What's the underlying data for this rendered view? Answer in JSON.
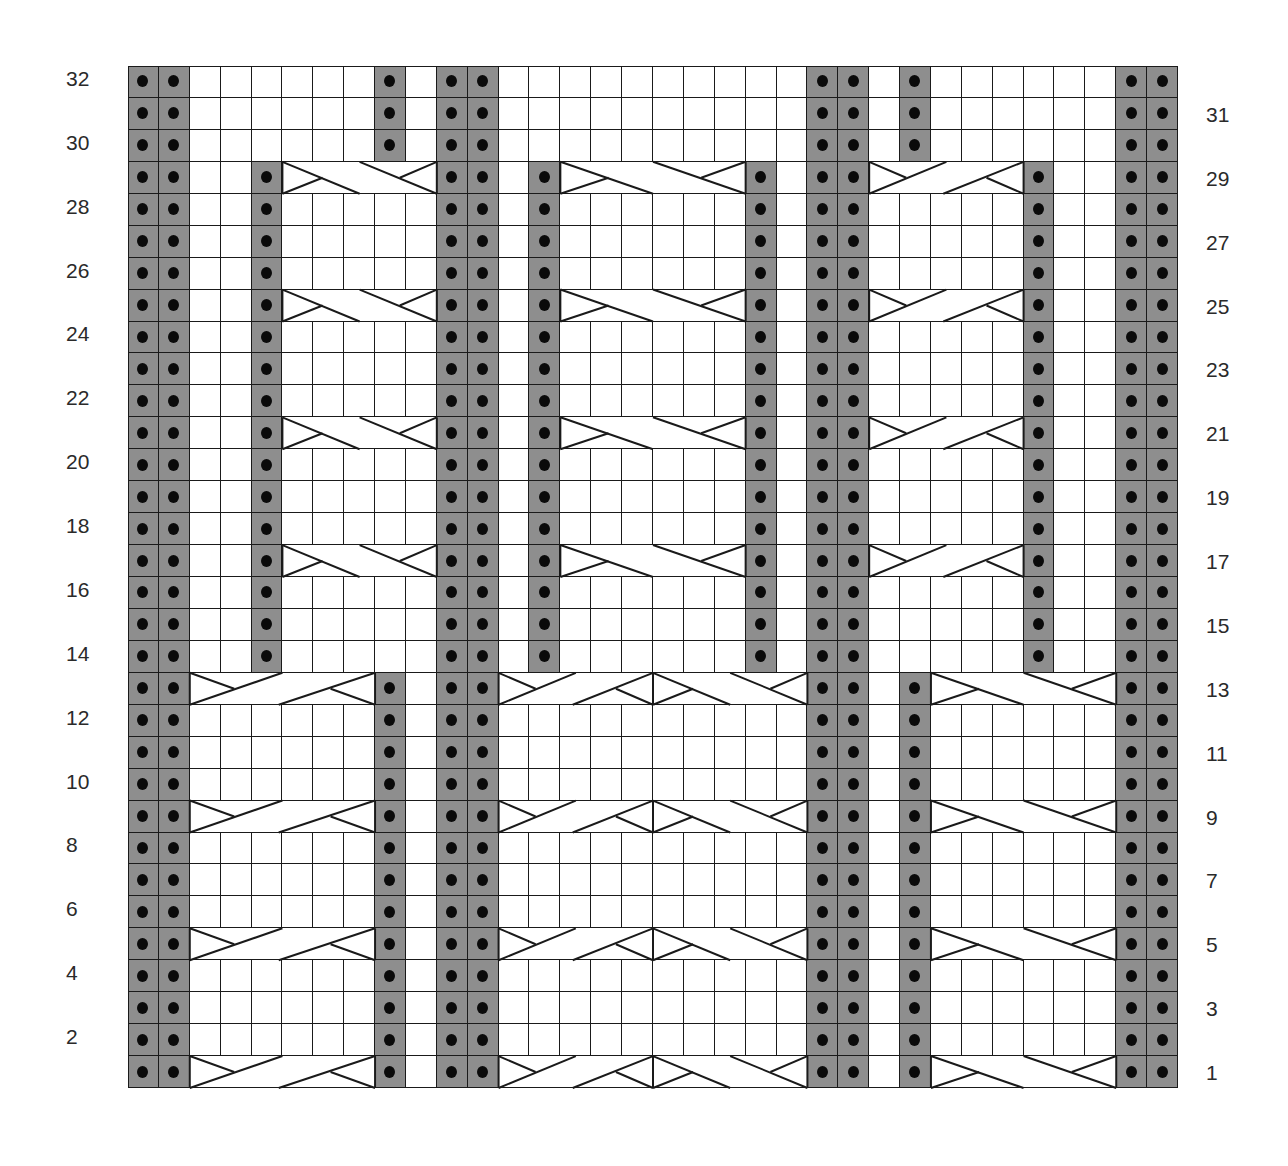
{
  "chart_data": {
    "type": "knitting-chart",
    "columns": 34,
    "rows": 32,
    "legend_key": {
      "p": "purl (gray cell with dot)",
      "k": "knit (white)",
      "L": "left-cross cable",
      "R": "right-cross cable"
    },
    "colors": {
      "purl": "#8e8e8e",
      "knit": "#ffffff",
      "dot": "#0a0a0a",
      "line": "#1a1a1a"
    },
    "grid_rows_top_to_bottom": [
      {
        "row": 32,
        "cells": "ppkkkkkkpkppkkkkkkkkkkppkpkkkkkkpp"
      },
      {
        "row": 31,
        "cells": "ppkkkkkkpkppkkkkkkkkkkppkpkkkkkkpp"
      },
      {
        "row": 30,
        "cells": "ppkkkkkkpkppkkkkkkkkkkppkpkkkkkkpp"
      },
      {
        "row": 29,
        "cells": "ppkkpRRRRRppkpRRRRRRpkppLLLLLpkkpp"
      },
      {
        "row": 28,
        "cells": "ppkkpkkkkkppkpkkkkkkpkppkkkkkpkkpp"
      },
      {
        "row": 27,
        "cells": "ppkkpkkkkkppkpkkkkkkpkppkkkkkpkkpp"
      },
      {
        "row": 26,
        "cells": "ppkkpkkkkkppkpkkkkkkpkppkkkkkpkkpp"
      },
      {
        "row": 25,
        "cells": "ppkkpRRRRRppkpRRRRRRpkppLLLLLpkkpp"
      },
      {
        "row": 24,
        "cells": "ppkkpkkkkkppkpkkkkkkpkppkkkkkpkkpp"
      },
      {
        "row": 23,
        "cells": "ppkkpkkkkkppkpkkkkkkpkppkkkkkpkkpp"
      },
      {
        "row": 22,
        "cells": "ppkkpkkkkkppkpkkkkkkpkppkkkkkpkkpp"
      },
      {
        "row": 21,
        "cells": "ppkkpRRRRRppkpRRRRRRpkppLLLLLpkkpp"
      },
      {
        "row": 20,
        "cells": "ppkkpkkkkkppkpkkkkkkpkppkkkkkpkkpp"
      },
      {
        "row": 19,
        "cells": "ppkkpkkkkkppkpkkkkkkpkppkkkkkpkkpp"
      },
      {
        "row": 18,
        "cells": "ppkkpkkkkkppkpkkkkkkpkppkkkkkpkkpp"
      },
      {
        "row": 17,
        "cells": "ppkkpRRRRRppkpRRRRRRpkppLLLLLpkkpp"
      },
      {
        "row": 16,
        "cells": "ppkkpkkkkkppkpkkkkkkpkppkkkkkpkkpp"
      },
      {
        "row": 15,
        "cells": "ppkkpkkkkkppkpkkkkkkpkppkkkkkpkkpp"
      },
      {
        "row": 14,
        "cells": "ppkkpkkkkkppkpkkkkkkpkppkkkkkpkkpp"
      },
      {
        "row": 13,
        "cells": "ppLLLLLLpkppLLLLLRRRRRppkpRRRRRRpp"
      },
      {
        "row": 12,
        "cells": "ppkkkkkkpkppkkkkkkkkkkppkpkkkkkkpp"
      },
      {
        "row": 11,
        "cells": "ppkkkkkkpkppkkkkkkkkkkppkpkkkkkkpp"
      },
      {
        "row": 10,
        "cells": "ppkkkkkkpkppkkkkkkkkkkppkpkkkkkkpp"
      },
      {
        "row": 9,
        "cells": "ppLLLLLLpkppLLLLLRRRRRppkpRRRRRRpp"
      },
      {
        "row": 8,
        "cells": "ppkkkkkkpkppkkkkkkkkkkppkpkkkkkkpp"
      },
      {
        "row": 7,
        "cells": "ppkkkkkkpkppkkkkkkkkkkppkpkkkkkkpp"
      },
      {
        "row": 6,
        "cells": "ppkkkkkkpkppkkkkkkkkkkppkpkkkkkkpp"
      },
      {
        "row": 5,
        "cells": "ppLLLLLLpkppLLLLLRRRRRppkpRRRRRRpp"
      },
      {
        "row": 4,
        "cells": "ppkkkkkkpkppkkkkkkkkkkppkpkkkkkkpp"
      },
      {
        "row": 3,
        "cells": "ppkkkkkkpkppkkkkkkkkkkppkpkkkkkkpp"
      },
      {
        "row": 2,
        "cells": "ppkkkkkkpkppkkkkkkkkkkppkpkkkkkkpp"
      },
      {
        "row": 1,
        "cells": "ppLLLLLLpkppLLLLLRRRRRppkpRRRRRRpp"
      }
    ],
    "cables": [
      {
        "rows": [
          1,
          5,
          9,
          13
        ],
        "start_col": 2,
        "width": 6,
        "type": "L"
      },
      {
        "rows": [
          1,
          5,
          9,
          13
        ],
        "start_col": 12,
        "width": 5,
        "type": "L"
      },
      {
        "rows": [
          1,
          5,
          9,
          13
        ],
        "start_col": 17,
        "width": 5,
        "type": "R"
      },
      {
        "rows": [
          1,
          5,
          9,
          13
        ],
        "start_col": 26,
        "width": 6,
        "type": "R"
      },
      {
        "rows": [
          17,
          21,
          25,
          29
        ],
        "start_col": 5,
        "width": 5,
        "type": "R"
      },
      {
        "rows": [
          17,
          21,
          25,
          29
        ],
        "start_col": 14,
        "width": 6,
        "type": "R"
      },
      {
        "rows": [
          17,
          21,
          25,
          29
        ],
        "start_col": 24,
        "width": 5,
        "type": "L"
      }
    ],
    "left_labels": [
      "32",
      "30",
      "28",
      "26",
      "24",
      "22",
      "20",
      "18",
      "16",
      "14",
      "12",
      "10",
      "8",
      "6",
      "4",
      "2"
    ],
    "right_labels": [
      "31",
      "29",
      "27",
      "25",
      "23",
      "21",
      "19",
      "17",
      "15",
      "13",
      "11",
      "9",
      "7",
      "5",
      "3",
      "1"
    ]
  }
}
